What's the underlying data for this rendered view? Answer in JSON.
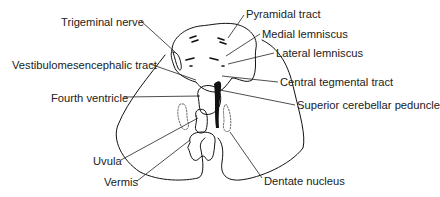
{
  "diagram": {
    "line_color": "#111111",
    "labels": [
      {
        "id": "trigeminal-nerve",
        "text": "Trigeminal nerve",
        "x": 61,
        "y": 16
      },
      {
        "id": "vestibulomesencephalic-tract",
        "text": "Vestibulomesencephalic tract",
        "x": 12,
        "y": 59
      },
      {
        "id": "fourth-ventricle",
        "text": "Fourth ventricle",
        "x": 51,
        "y": 92
      },
      {
        "id": "uvula",
        "text": "Uvula",
        "x": 93,
        "y": 155
      },
      {
        "id": "vermis",
        "text": "Vermis",
        "x": 104,
        "y": 176
      },
      {
        "id": "pyramidal-tract",
        "text": "Pyramidal tract",
        "x": 246,
        "y": 8
      },
      {
        "id": "medial-lemniscus",
        "text": "Medial lemniscus",
        "x": 262,
        "y": 28
      },
      {
        "id": "lateral-lemniscus",
        "text": "Lateral lemniscus",
        "x": 276,
        "y": 47
      },
      {
        "id": "central-tegmental-tract",
        "text": "Central tegmental tract",
        "x": 280,
        "y": 76
      },
      {
        "id": "superior-cerebellar-peduncle",
        "text": "Superior cerebellar peduncle",
        "x": 297,
        "y": 99
      },
      {
        "id": "dentate-nucleus",
        "text": "Dentate nucleus",
        "x": 264,
        "y": 175
      }
    ]
  }
}
